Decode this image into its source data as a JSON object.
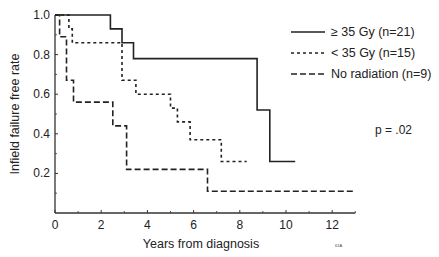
{
  "chart_data": {
    "type": "line",
    "subtype": "kaplan-meier-step",
    "title": "",
    "xlabel": "Years from diagnosis",
    "ylabel": "Infield failure free rate",
    "xlim": [
      0,
      13
    ],
    "ylim": [
      0,
      1.0
    ],
    "x_ticks": [
      0,
      2,
      4,
      6,
      8,
      10,
      12
    ],
    "x_minor_ticks": [
      1,
      3,
      5,
      7,
      9,
      11,
      13
    ],
    "y_ticks": [
      0.2,
      0.4,
      0.6,
      0.8,
      1.0
    ],
    "y_tick_labels": [
      "0.2",
      "0.4",
      "0.6",
      "0.8",
      "1.0"
    ],
    "x_tick_labels": [
      "0",
      "2",
      "4",
      "6",
      "8",
      "10",
      "12"
    ],
    "grid": false,
    "legend_position": "upper right",
    "series": [
      {
        "name": "≥ 35 Gy (n=21)",
        "style": "solid",
        "x": [
          0,
          2.4,
          2.4,
          2.9,
          2.9,
          3.4,
          3.4,
          8.75,
          8.75,
          9.3,
          9.3,
          10.4
        ],
        "y": [
          1.0,
          1.0,
          0.93,
          0.93,
          0.86,
          0.86,
          0.78,
          0.78,
          0.52,
          0.52,
          0.26,
          0.26
        ]
      },
      {
        "name": "< 35 Gy (n=15)",
        "style": "dotted",
        "x": [
          0,
          0.6,
          0.6,
          0.75,
          0.75,
          2.9,
          2.9,
          3.5,
          3.5,
          5.0,
          5.0,
          5.3,
          5.3,
          5.85,
          5.85,
          7.2,
          7.2,
          8.3
        ],
        "y": [
          1.0,
          1.0,
          0.93,
          0.93,
          0.86,
          0.86,
          0.67,
          0.67,
          0.6,
          0.6,
          0.53,
          0.53,
          0.46,
          0.46,
          0.37,
          0.37,
          0.26,
          0.26
        ]
      },
      {
        "name": "No radiation (n=9)",
        "style": "dashed",
        "x": [
          0,
          0.2,
          0.2,
          0.5,
          0.5,
          0.8,
          0.8,
          2.5,
          2.5,
          3.1,
          3.1,
          6.6,
          6.6,
          13.0
        ],
        "y": [
          1.0,
          1.0,
          0.89,
          0.89,
          0.67,
          0.67,
          0.56,
          0.56,
          0.44,
          0.44,
          0.22,
          0.22,
          0.11,
          0.11
        ]
      }
    ],
    "annotations": [
      "p = .02",
      "61A"
    ]
  },
  "legend": {
    "items": [
      {
        "label": "≥ 35 Gy (n=21)",
        "style": "solid"
      },
      {
        "label": "< 35 Gy (n=15)",
        "style": "dotted"
      },
      {
        "label": "No radiation (n=9)",
        "style": "dashed"
      }
    ]
  },
  "annotations": {
    "p_value": "p = .02",
    "figure_code": "61A"
  },
  "axes": {
    "xlabel": "Years from diagnosis",
    "ylabel": "Infield failure free rate",
    "x_tick_labels": [
      "0",
      "2",
      "4",
      "6",
      "8",
      "10",
      "12"
    ],
    "y_tick_labels": [
      "0.2",
      "0.4",
      "0.6",
      "0.8",
      "1.0"
    ]
  },
  "colors": {
    "line": "#222222",
    "axis": "#333333",
    "background": "#ffffff"
  }
}
